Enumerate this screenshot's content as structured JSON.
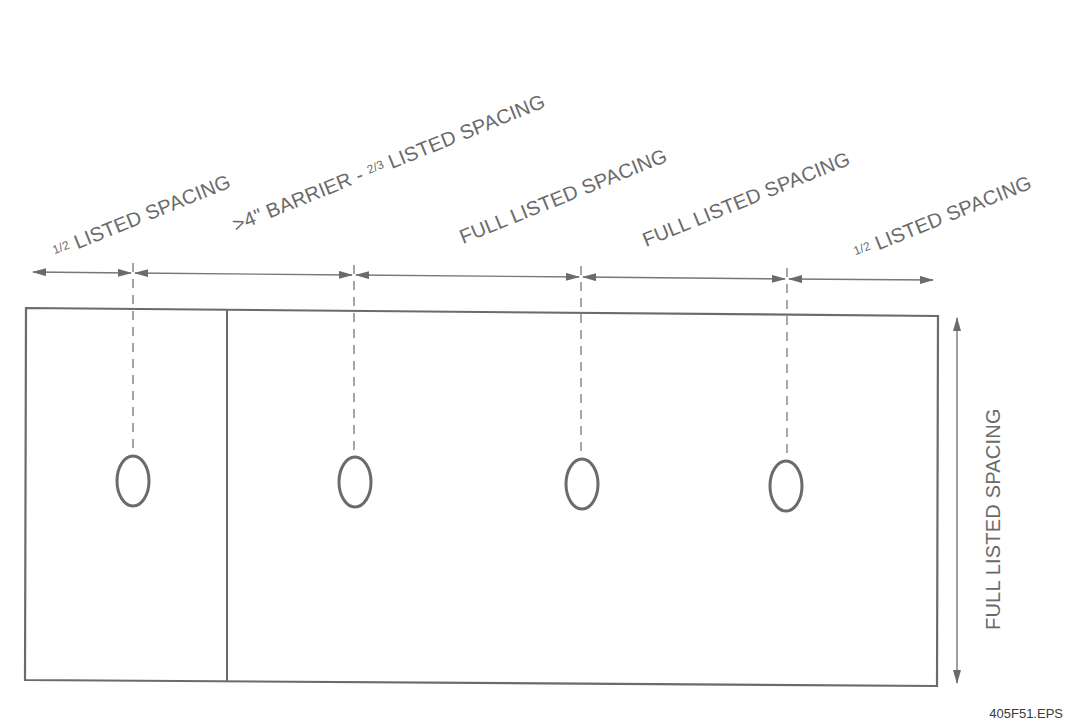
{
  "diagram": {
    "colors": {
      "line": "#6b6b6b",
      "text": "#6a6a6a",
      "background": "#ffffff"
    },
    "spacing_labels": [
      {
        "fraction": "1/2",
        "text": "LISTED SPACING"
      },
      {
        "prefix": ">4\" BARRIER - ",
        "fraction": "2/3",
        "text": "LISTED SPACING"
      },
      {
        "text": "FULL LISTED SPACING"
      },
      {
        "text": "FULL LISTED SPACING"
      },
      {
        "fraction": "1/2",
        "text": "LISTED SPACING"
      }
    ],
    "vertical_label": "FULL LISTED SPACING",
    "sprinkler_count": 4,
    "footer_id": "405F51.EPS"
  }
}
